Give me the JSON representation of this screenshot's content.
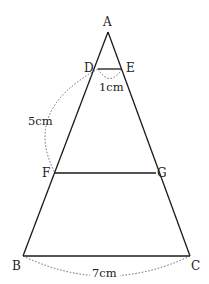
{
  "diagram": {
    "type": "triangle-with-parallel-segments",
    "points": {
      "A": {
        "label": "A",
        "x": 108,
        "y": 32
      },
      "D": {
        "label": "D",
        "x": 98,
        "y": 69
      },
      "E": {
        "label": "E",
        "x": 122,
        "y": 69
      },
      "F": {
        "label": "F",
        "x": 55,
        "y": 173
      },
      "G": {
        "label": "G",
        "x": 156,
        "y": 173
      },
      "B": {
        "label": "B",
        "x": 23,
        "y": 256
      },
      "C": {
        "label": "C",
        "x": 190,
        "y": 256
      }
    },
    "segments": [
      "AB",
      "AC",
      "DE",
      "FG",
      "BC"
    ],
    "measurements": {
      "DE": "1cm",
      "DF": "5cm",
      "BC": "7cm"
    },
    "colors": {
      "line": "#1a1a1a",
      "dotted": "#555555",
      "background": "#ffffff"
    }
  }
}
